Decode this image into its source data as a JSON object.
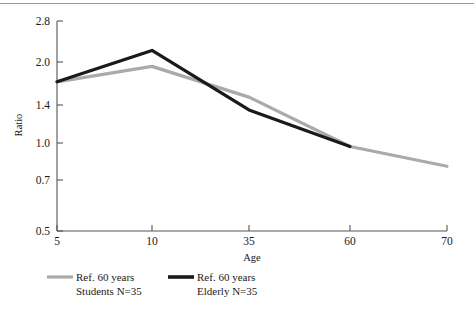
{
  "chart_data": {
    "type": "line",
    "title": "",
    "xlabel": "Age",
    "ylabel": "Ratio",
    "x": [
      5,
      10,
      35,
      60,
      70
    ],
    "xticks": [
      5,
      10,
      35,
      60,
      70
    ],
    "xtick_labels": [
      "5",
      "10",
      "35",
      "60",
      "70"
    ],
    "yticks": [
      0.5,
      0.7,
      1.0,
      1.4,
      2.0,
      2.8
    ],
    "ytick_labels": [
      "0.5",
      "0.7",
      "1.0",
      "1.4",
      "2.0",
      "2.8"
    ],
    "ylim": [
      0.5,
      2.8
    ],
    "yscale": "log",
    "grid": false,
    "legend_position": "below-left",
    "series": [
      {
        "name": "Ref. 60 years Students N=35",
        "legend_line1": "Ref. 60 years",
        "legend_line2": "Students N=35",
        "color": "#aaaaaa",
        "x": [
          5,
          10,
          35,
          60,
          70
        ],
        "values": [
          1.7,
          1.93,
          1.5,
          1.0,
          0.85
        ]
      },
      {
        "name": "Ref. 60 years Elderly N=35",
        "legend_line1": "Ref. 60 years",
        "legend_line2": "Elderly N=35",
        "color": "#1a1a1a",
        "x": [
          5,
          10,
          35,
          60
        ],
        "values": [
          1.7,
          2.2,
          1.35,
          1.0
        ]
      }
    ]
  },
  "axes": {
    "y_title": "Ratio",
    "x_title": "Age",
    "y_labels": [
      "2.8",
      "2.0",
      "1.4",
      "1.0",
      "0.7",
      "0.5"
    ],
    "x_labels": [
      "5",
      "10",
      "35",
      "60",
      "70"
    ]
  },
  "legend": {
    "students": {
      "line1": "Ref. 60 years",
      "line2": "Students N=35",
      "swatch_color": "#aaaaaa"
    },
    "elderly": {
      "line1": "Ref. 60 years",
      "line2": "Elderly N=35",
      "swatch_color": "#1a1a1a"
    }
  }
}
